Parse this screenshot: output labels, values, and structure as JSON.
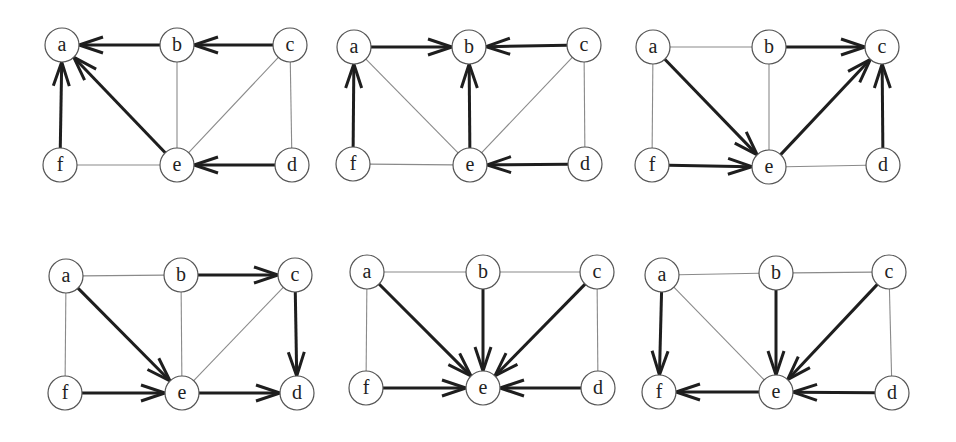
{
  "figure": {
    "node_radius": 17,
    "colors": {
      "bold_edge": "#1e1e1e",
      "thin_edge": "#8a8a8a",
      "node_stroke": "#555555",
      "node_fill": "#ffffff",
      "label": "#222222"
    }
  },
  "panels": [
    {
      "id": "panel-1",
      "nodes": {
        "a": {
          "label": "a",
          "x": 62,
          "y": 45
        },
        "b": {
          "label": "b",
          "x": 177,
          "y": 45
        },
        "c": {
          "label": "c",
          "x": 290,
          "y": 45
        },
        "f": {
          "label": "f",
          "x": 60,
          "y": 165
        },
        "e": {
          "label": "e",
          "x": 177,
          "y": 165
        },
        "d": {
          "label": "d",
          "x": 292,
          "y": 165
        }
      },
      "directed_edges": [
        [
          "b",
          "a"
        ],
        [
          "c",
          "b"
        ],
        [
          "f",
          "a"
        ],
        [
          "e",
          "a"
        ],
        [
          "d",
          "e"
        ]
      ],
      "undirected_edges": [
        [
          "b",
          "e"
        ],
        [
          "c",
          "e"
        ],
        [
          "c",
          "d"
        ],
        [
          "f",
          "e"
        ]
      ]
    },
    {
      "id": "panel-2",
      "nodes": {
        "a": {
          "label": "a",
          "x": 354,
          "y": 47
        },
        "b": {
          "label": "b",
          "x": 469,
          "y": 47
        },
        "c": {
          "label": "c",
          "x": 584,
          "y": 45
        },
        "f": {
          "label": "f",
          "x": 353,
          "y": 164
        },
        "e": {
          "label": "e",
          "x": 470,
          "y": 165
        },
        "d": {
          "label": "d",
          "x": 585,
          "y": 164
        }
      },
      "directed_edges": [
        [
          "a",
          "b"
        ],
        [
          "c",
          "b"
        ],
        [
          "f",
          "a"
        ],
        [
          "e",
          "b"
        ],
        [
          "d",
          "e"
        ]
      ],
      "undirected_edges": [
        [
          "a",
          "e"
        ],
        [
          "c",
          "e"
        ],
        [
          "c",
          "d"
        ],
        [
          "f",
          "e"
        ]
      ]
    },
    {
      "id": "panel-3",
      "nodes": {
        "a": {
          "label": "a",
          "x": 653,
          "y": 47
        },
        "b": {
          "label": "b",
          "x": 769,
          "y": 47
        },
        "c": {
          "label": "c",
          "x": 882,
          "y": 47
        },
        "f": {
          "label": "f",
          "x": 652,
          "y": 165
        },
        "e": {
          "label": "e",
          "x": 769,
          "y": 167
        },
        "d": {
          "label": "d",
          "x": 883,
          "y": 165
        }
      },
      "directed_edges": [
        [
          "b",
          "c"
        ],
        [
          "a",
          "e"
        ],
        [
          "e",
          "c"
        ],
        [
          "d",
          "c"
        ],
        [
          "f",
          "e"
        ]
      ],
      "undirected_edges": [
        [
          "a",
          "b"
        ],
        [
          "a",
          "f"
        ],
        [
          "b",
          "e"
        ],
        [
          "e",
          "d"
        ]
      ]
    },
    {
      "id": "panel-4",
      "nodes": {
        "a": {
          "label": "a",
          "x": 66,
          "y": 276
        },
        "b": {
          "label": "b",
          "x": 181,
          "y": 275
        },
        "c": {
          "label": "c",
          "x": 295,
          "y": 275
        },
        "f": {
          "label": "f",
          "x": 65,
          "y": 393
        },
        "e": {
          "label": "e",
          "x": 182,
          "y": 393
        },
        "d": {
          "label": "d",
          "x": 297,
          "y": 393
        }
      },
      "directed_edges": [
        [
          "b",
          "c"
        ],
        [
          "a",
          "e"
        ],
        [
          "c",
          "d"
        ],
        [
          "f",
          "e"
        ],
        [
          "e",
          "d"
        ]
      ],
      "undirected_edges": [
        [
          "a",
          "b"
        ],
        [
          "a",
          "f"
        ],
        [
          "b",
          "e"
        ],
        [
          "c",
          "e"
        ]
      ]
    },
    {
      "id": "panel-5",
      "nodes": {
        "a": {
          "label": "a",
          "x": 367,
          "y": 272
        },
        "b": {
          "label": "b",
          "x": 483,
          "y": 272
        },
        "c": {
          "label": "c",
          "x": 597,
          "y": 272
        },
        "f": {
          "label": "f",
          "x": 366,
          "y": 388
        },
        "e": {
          "label": "e",
          "x": 483,
          "y": 388
        },
        "d": {
          "label": "d",
          "x": 598,
          "y": 388
        }
      },
      "directed_edges": [
        [
          "a",
          "e"
        ],
        [
          "b",
          "e"
        ],
        [
          "c",
          "e"
        ],
        [
          "f",
          "e"
        ],
        [
          "d",
          "e"
        ]
      ],
      "undirected_edges": [
        [
          "a",
          "b"
        ],
        [
          "b",
          "c"
        ],
        [
          "a",
          "f"
        ],
        [
          "c",
          "d"
        ]
      ]
    },
    {
      "id": "panel-6",
      "nodes": {
        "a": {
          "label": "a",
          "x": 662,
          "y": 275
        },
        "b": {
          "label": "b",
          "x": 776,
          "y": 273
        },
        "c": {
          "label": "c",
          "x": 889,
          "y": 272
        },
        "f": {
          "label": "f",
          "x": 659,
          "y": 392
        },
        "e": {
          "label": "e",
          "x": 776,
          "y": 392
        },
        "d": {
          "label": "d",
          "x": 892,
          "y": 393
        }
      },
      "directed_edges": [
        [
          "a",
          "f"
        ],
        [
          "b",
          "e"
        ],
        [
          "c",
          "e"
        ],
        [
          "e",
          "f"
        ],
        [
          "d",
          "e"
        ]
      ],
      "undirected_edges": [
        [
          "a",
          "b"
        ],
        [
          "b",
          "c"
        ],
        [
          "a",
          "e"
        ],
        [
          "c",
          "d"
        ]
      ]
    }
  ]
}
